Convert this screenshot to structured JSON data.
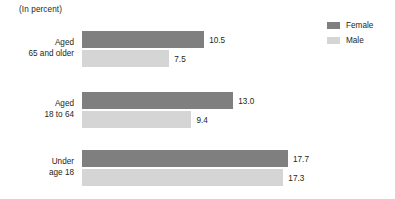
{
  "chart_data": {
    "type": "bar",
    "orientation": "horizontal",
    "title": "",
    "subtitle": "(In percent)",
    "xlabel": "",
    "ylabel": "",
    "grid": false,
    "legend_position": "top-right",
    "xlim": [
      0,
      17.7
    ],
    "categories": [
      {
        "line1": "Aged",
        "line2": "65 and older"
      },
      {
        "line1": "Aged",
        "line2": "18 to 64"
      },
      {
        "line1": "Under",
        "line2": "age 18"
      }
    ],
    "series": [
      {
        "name": "Female",
        "color": "#7f7f7f",
        "values": [
          10.5,
          13.0,
          17.7
        ],
        "labels": [
          "10.5",
          "13.0",
          "17.7"
        ]
      },
      {
        "name": "Male",
        "color": "#d5d5d5",
        "values": [
          7.5,
          9.4,
          17.3
        ],
        "labels": [
          "7.5",
          "9.4",
          "17.3"
        ]
      }
    ]
  },
  "legend": {
    "items": [
      {
        "label": "Female",
        "color": "#7f7f7f"
      },
      {
        "label": "Male",
        "color": "#d5d5d5"
      }
    ]
  }
}
